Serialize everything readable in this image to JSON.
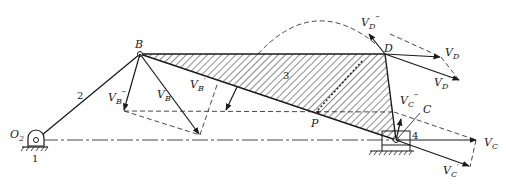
{
  "diagram": {
    "type": "four-bar linkage velocity diagram (slider-crank with coupler)",
    "links": {
      "ground": "1",
      "crank": "2",
      "coupler": "3",
      "slider": "4"
    },
    "points": {
      "O2": "O",
      "O2_sub": "2",
      "B": "B",
      "C": "C",
      "D": "D",
      "P": "P"
    },
    "vectors": {
      "VB": {
        "main": "V",
        "sub": "B",
        "prime": ""
      },
      "VB1": {
        "main": "V",
        "sub": "B",
        "prime": "′"
      },
      "VB2": {
        "main": "V",
        "sub": "B",
        "prime": "‴"
      },
      "VC": {
        "main": "V",
        "sub": "C",
        "prime": ""
      },
      "VC1": {
        "main": "V",
        "sub": "C",
        "prime": "′"
      },
      "VC2": {
        "main": "V",
        "sub": "C",
        "prime": "‴"
      },
      "VD": {
        "main": "V",
        "sub": "D",
        "prime": ""
      },
      "VD1": {
        "main": "V",
        "sub": "D",
        "prime": "′"
      },
      "VD2": {
        "main": "V",
        "sub": "D",
        "prime": "‴"
      }
    },
    "colors": {
      "ink": "#1a1a1a",
      "background": "#ffffff"
    }
  }
}
